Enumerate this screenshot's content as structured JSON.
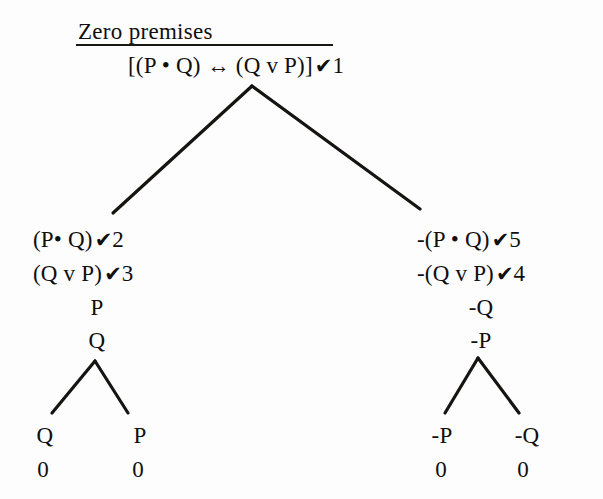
{
  "diagram": {
    "title": "Zero premises",
    "notation": {
      "conjunction": "•",
      "disjunction": "v",
      "biconditional": "↔",
      "negation": "-",
      "check": "✔",
      "open_branch": "0"
    },
    "root": {
      "formula_prefix": "[(P ",
      "formula_mid1": " Q) ",
      "formula_mid2": " (Q v P)]",
      "full_text": "[(P • Q) ↔ (Q v P)]",
      "check": "✔",
      "number": "1"
    },
    "left_branch": {
      "lines": [
        {
          "text": "(P• Q)",
          "check": "✔",
          "number": "2"
        },
        {
          "text": "(Q v P)",
          "check": "✔",
          "number": "3"
        }
      ],
      "stack": [
        "P",
        "Q"
      ],
      "terminals": [
        {
          "label": "Q",
          "status": "0"
        },
        {
          "label": "P",
          "status": "0"
        }
      ]
    },
    "right_branch": {
      "lines": [
        {
          "text": "-(P • Q)",
          "check": "✔",
          "number": "5"
        },
        {
          "text": "-(Q v P)",
          "check": "✔",
          "number": "4"
        }
      ],
      "stack": [
        "-Q",
        "-P"
      ],
      "terminals": [
        {
          "label": "-P",
          "status": "0"
        },
        {
          "label": "-Q",
          "status": "0"
        }
      ]
    },
    "colors": {
      "ink": "#100f0d",
      "paper": "#fdfdfd",
      "rule": "#191814"
    }
  }
}
